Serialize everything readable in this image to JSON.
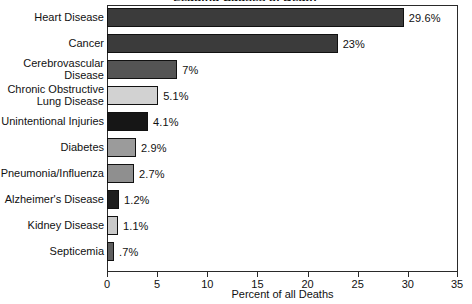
{
  "chart_data": {
    "type": "bar",
    "orientation": "horizontal",
    "title": "Leading Causes of Death",
    "xlabel": "Percent of all Deaths",
    "ylabel": "",
    "xlim": [
      0,
      35
    ],
    "xticks": [
      0,
      5,
      10,
      15,
      20,
      25,
      30,
      35
    ],
    "xtick_labels": [
      "0",
      "5",
      "10",
      "15",
      "20",
      "25",
      "30",
      "35"
    ],
    "grid": false,
    "legend": false,
    "categories": [
      "Heart Disease",
      "Cancer",
      "Cerebrovascular\nDisease",
      "Chronic Obstructive\nLung Disease",
      "Unintentional Injuries",
      "Diabetes",
      "Pneumonia/Influenza",
      "Alzheimer's Disease",
      "Kidney Disease",
      "Septicemia"
    ],
    "values": [
      29.6,
      23,
      7,
      5.1,
      4.1,
      2.9,
      2.7,
      1.2,
      1.1,
      0.7
    ],
    "value_labels": [
      "29.6%",
      "23%",
      "7%",
      "5.1%",
      "4.1%",
      "2.9%",
      "2.7%",
      "1.2%",
      "1.1%",
      ".7%"
    ],
    "bar_colors": [
      "#3b3b3b",
      "#3b3b3b",
      "#545454",
      "#d2d2d2",
      "#161616",
      "#9b9b9b",
      "#8f8f8f",
      "#1e1e1e",
      "#c9c9c9",
      "#5f5f5f"
    ],
    "bar_outline_color": "#111111",
    "axis_color": "#2a2a2a",
    "background_color": "#ffffff",
    "text_color": "#111111"
  }
}
